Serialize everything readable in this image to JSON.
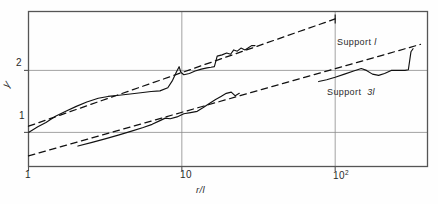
{
  "figure": {
    "background": "#fefefe",
    "frame_color": "#555555",
    "grid_color": "#8a8a8a",
    "curve_color": "#111111"
  },
  "axes": {
    "y_label": "γ",
    "x_label": "r/l",
    "x_tick_labels": [
      "1",
      "10",
      "10"
    ],
    "x_tick_exponent": "2",
    "y_tick_labels": [
      "1",
      "2"
    ]
  },
  "annotations": {
    "upper": "Support",
    "upper_value": "l",
    "lower": "Support",
    "lower_value": "3l"
  },
  "chart_data": {
    "type": "line",
    "title": "",
    "xlabel": "r/l",
    "ylabel": "γ",
    "xscale": "log",
    "yscale": "linear",
    "xlim": [
      1,
      400
    ],
    "ylim": [
      0.45,
      2.95
    ],
    "grid": true,
    "xticks": [
      1,
      10,
      100
    ],
    "xticklabels": [
      "1",
      "10",
      "10²"
    ],
    "yticks": [
      1,
      2
    ],
    "yticklabels": [
      "1",
      "2"
    ],
    "legend_position": "inline-right",
    "series": [
      {
        "name": "Support l",
        "style": "solid",
        "comment": "measured curve, support length l",
        "points": [
          [
            1.0,
            1.0
          ],
          [
            1.15,
            1.09
          ],
          [
            1.3,
            1.16
          ],
          [
            1.5,
            1.26
          ],
          [
            1.75,
            1.34
          ],
          [
            2.05,
            1.42
          ],
          [
            2.4,
            1.49
          ],
          [
            2.85,
            1.55
          ],
          [
            3.3,
            1.58
          ],
          [
            3.9,
            1.6
          ],
          [
            4.6,
            1.62
          ],
          [
            5.4,
            1.64
          ],
          [
            6.3,
            1.66
          ],
          [
            7.2,
            1.67
          ],
          [
            8.1,
            1.72
          ],
          [
            8.7,
            1.84
          ],
          [
            9.2,
            1.97
          ],
          [
            9.6,
            2.06
          ],
          [
            9.85,
            1.97
          ],
          [
            10.3,
            1.93
          ],
          [
            11.2,
            1.95
          ],
          [
            12.2,
            1.99
          ],
          [
            13.4,
            2.02
          ],
          [
            14.6,
            2.04
          ],
          [
            15.5,
            2.05
          ],
          [
            16.3,
            2.06
          ],
          [
            17.0,
            2.23
          ],
          [
            18.3,
            2.25
          ],
          [
            19.6,
            2.28
          ],
          [
            20.8,
            2.26
          ],
          [
            21.8,
            2.33
          ],
          [
            23.0,
            2.31
          ],
          [
            24.3,
            2.36
          ],
          [
            25.8,
            2.33
          ],
          [
            27.0,
            2.36
          ],
          [
            28.5,
            2.4
          ],
          [
            30.0,
            2.4
          ]
        ]
      },
      {
        "name": "Support l fit",
        "style": "dashed",
        "comment": "straight reference line for support l",
        "points": [
          [
            1.0,
            1.1
          ],
          [
            100.0,
            2.83
          ]
        ]
      },
      {
        "name": "Support 3l",
        "style": "solid",
        "comment": "measured curve, support length 3l",
        "points": [
          [
            2.1,
            0.78
          ],
          [
            2.6,
            0.84
          ],
          [
            3.2,
            0.9
          ],
          [
            3.9,
            0.96
          ],
          [
            4.7,
            1.02
          ],
          [
            5.6,
            1.08
          ],
          [
            6.4,
            1.13
          ],
          [
            7.2,
            1.19
          ],
          [
            7.8,
            1.23
          ],
          [
            8.4,
            1.22
          ],
          [
            9.3,
            1.25
          ],
          [
            10.3,
            1.3
          ],
          [
            11.4,
            1.32
          ],
          [
            12.6,
            1.34
          ],
          [
            13.8,
            1.4
          ],
          [
            15.2,
            1.47
          ],
          [
            16.6,
            1.53
          ],
          [
            18.0,
            1.58
          ],
          [
            19.5,
            1.63
          ],
          [
            21.0,
            1.65
          ],
          [
            22.3,
            1.59
          ],
          [
            23.7,
            1.63
          ]
        ]
      },
      {
        "name": "Support 3l tail",
        "style": "solid",
        "comment": "right-hand branch of the 3l curve",
        "points": [
          [
            78.0,
            1.82
          ],
          [
            88.0,
            1.85
          ],
          [
            100.0,
            1.89
          ],
          [
            115.0,
            1.94
          ],
          [
            132.0,
            1.99
          ],
          [
            148.0,
            2.03
          ],
          [
            160.0,
            2.0
          ],
          [
            175.0,
            1.94
          ],
          [
            192.0,
            1.92
          ],
          [
            210.0,
            1.95
          ],
          [
            232.0,
            2.0
          ],
          [
            258.0,
            2.0
          ],
          [
            285.0,
            2.0
          ],
          [
            300.0,
            2.01
          ],
          [
            312.0,
            2.3
          ],
          [
            322.0,
            2.35
          ]
        ]
      },
      {
        "name": "Support 3l fit",
        "style": "dashed",
        "comment": "straight reference line for support 3l",
        "points": [
          [
            1.0,
            0.62
          ],
          [
            360.0,
            2.42
          ]
        ]
      }
    ]
  }
}
